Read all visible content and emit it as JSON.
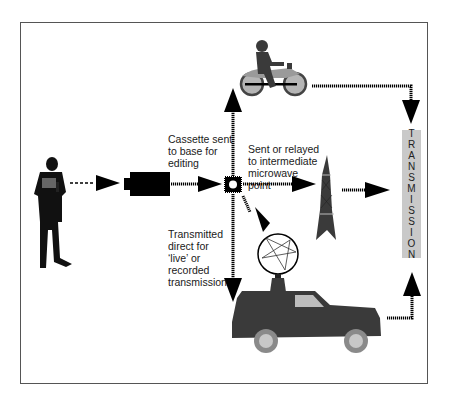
{
  "diagram": {
    "labels": {
      "cassette": "Cassette sent\nto base for\nediting",
      "relayed": "Sent or relayed\nto intermediate\nmicrowave\npoint",
      "direct": "Transmitted\ndirect for\n‘live’ or\nrecorded\ntransmission"
    },
    "transmission": {
      "letters": [
        "T",
        "R",
        "A",
        "N",
        "S",
        "M",
        "I",
        "S",
        "S",
        "I",
        "O",
        "N"
      ],
      "word": "TRANSMISSION"
    },
    "nodes": [
      {
        "id": "reporter",
        "icon": "reporter-icon"
      },
      {
        "id": "camera",
        "icon": "camera-icon"
      },
      {
        "id": "hub",
        "icon": "hub-icon"
      },
      {
        "id": "motorbike",
        "icon": "motorbike-icon"
      },
      {
        "id": "microwave-tower",
        "icon": "tower-icon"
      },
      {
        "id": "satellite-dish",
        "icon": "dish-icon"
      },
      {
        "id": "ob-truck",
        "icon": "truck-icon"
      },
      {
        "id": "transmission",
        "icon": "transmission-box"
      }
    ],
    "colors": {
      "frame": "#555555",
      "ink": "#000000",
      "vehicle": "#3a3a3a",
      "wheel": "#8a8a8a",
      "wheel_hub": "#c8c8c8",
      "window": "#bdbdbd",
      "tx_box": "#c9c9c9"
    }
  }
}
